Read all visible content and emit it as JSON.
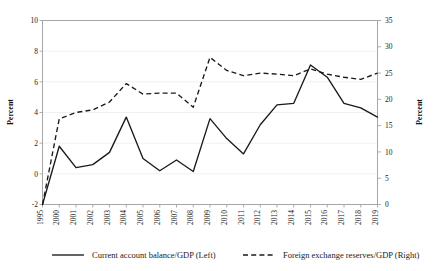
{
  "chart_data": {
    "type": "line",
    "title": "",
    "subtitle": "",
    "xlabel": "",
    "ylabel": "Percent",
    "y2label": "Percent",
    "grid": true,
    "legend_position": "bottom",
    "categories": [
      "1995",
      "2000",
      "2001",
      "2002",
      "2003",
      "2004",
      "2005",
      "2006",
      "2007",
      "2008",
      "2009",
      "2010",
      "2011",
      "2012",
      "2013",
      "2014",
      "2015",
      "2016",
      "2017",
      "2018",
      "2019"
    ],
    "axes": {
      "left": {
        "label": "Percent",
        "ylim": [
          -2,
          10
        ],
        "ticks": [
          -2,
          0,
          2,
          4,
          6,
          8,
          10
        ],
        "tick_labels": [
          "-2",
          "0",
          "2",
          "4",
          "6",
          "8",
          "10"
        ]
      },
      "right": {
        "label": "Percent",
        "ylim": [
          0,
          35
        ],
        "ticks": [
          0,
          5,
          10,
          15,
          20,
          25,
          30,
          35
        ],
        "tick_labels": [
          "0",
          "5",
          "10",
          "15",
          "20",
          "25",
          "30",
          "35"
        ]
      }
    },
    "series": [
      {
        "name": "Current account balance/GDP (Left)",
        "axis": "left",
        "style": "solid",
        "color": "#1a1a1a",
        "values": [
          -2.0,
          1.8,
          0.4,
          0.6,
          1.4,
          3.7,
          1.0,
          0.2,
          0.9,
          0.15,
          3.6,
          2.3,
          1.3,
          3.2,
          4.5,
          4.6,
          7.1,
          6.3,
          4.6,
          4.3,
          3.7
        ]
      },
      {
        "name": "Foreign exchange reserves/GDP (Right)",
        "axis": "right",
        "style": "dashed",
        "color": "#1a1a1a",
        "values": [
          0.0,
          16.3,
          17.5,
          18.0,
          19.5,
          23.0,
          21.0,
          21.2,
          21.2,
          18.5,
          28.0,
          25.5,
          24.5,
          25.0,
          24.8,
          24.5,
          25.8,
          24.8,
          24.2,
          23.8,
          25.0
        ]
      }
    ]
  },
  "legend": {
    "items": [
      {
        "label": "Current account balance/GDP (Left)",
        "style": "solid"
      },
      {
        "label": "Foreign exchange reserves/GDP (Right)",
        "style": "dashed"
      }
    ]
  }
}
